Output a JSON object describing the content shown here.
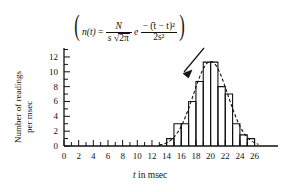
{
  "figure": {
    "title": "",
    "formula": {
      "lhs": "n(t)",
      "equals": "=",
      "frac1_num": "N",
      "frac1_den_s": "s",
      "frac1_den_radical": "2π",
      "e": "e",
      "frac2_num": "− (̄t − t)²",
      "frac2_den": "2s²",
      "plain": "n(t) = N / (s √(2π)) e^{ −(t̄ − t)² / 2s² }"
    },
    "annotation": {
      "name": "arrow-pointing-to-curve"
    }
  },
  "chart_data": {
    "type": "bar",
    "title": "",
    "xlabel": "t in msec",
    "ylabel": "Number of readings per msec",
    "ylabel_line1": "Number of readings",
    "ylabel_line2": "per msec",
    "xlim": [
      0,
      27
    ],
    "ylim": [
      0,
      13
    ],
    "xticks_major": [
      0,
      2,
      4,
      6,
      8,
      10,
      12,
      14,
      16,
      18,
      20,
      22,
      24,
      26
    ],
    "xticks_major_labels": [
      "0",
      "2",
      "4",
      "6",
      "8",
      "10",
      "12",
      "14",
      "16",
      "18",
      "20",
      "22",
      "24",
      "26"
    ],
    "xticks_minor_step": 1,
    "yticks_major": [
      0,
      2,
      4,
      6,
      8,
      10,
      12
    ],
    "yticks_major_labels": [
      "0",
      "2",
      "4",
      "6",
      "8",
      "10",
      "12"
    ],
    "yticks_minor_step": 1,
    "grid": false,
    "legend": false,
    "bin_width": 1,
    "categories": [
      14,
      15,
      16,
      17,
      18,
      19,
      20,
      21,
      22,
      23,
      24,
      25
    ],
    "values": [
      1,
      3,
      3,
      6,
      8.7,
      11.3,
      11.3,
      8,
      7,
      3,
      1.5,
      1
    ],
    "bars": [
      {
        "x_start": 14,
        "x_end": 15,
        "height": 1
      },
      {
        "x_start": 15,
        "x_end": 16,
        "height": 3
      },
      {
        "x_start": 16,
        "x_end": 17,
        "height": 3
      },
      {
        "x_start": 17,
        "x_end": 18,
        "height": 6
      },
      {
        "x_start": 18,
        "x_end": 19,
        "height": 8.7
      },
      {
        "x_start": 19,
        "x_end": 20,
        "height": 11.3
      },
      {
        "x_start": 20,
        "x_end": 21,
        "height": 11.3
      },
      {
        "x_start": 21,
        "x_end": 22,
        "height": 8
      },
      {
        "x_start": 22,
        "x_end": 23,
        "height": 7
      },
      {
        "x_start": 23,
        "x_end": 24,
        "height": 3
      },
      {
        "x_start": 24,
        "x_end": 25,
        "height": 1.5
      },
      {
        "x_start": 25,
        "x_end": 26,
        "height": 1
      }
    ],
    "curve": {
      "name": "gaussian-fit",
      "style": "dashed",
      "mean": 20.0,
      "sigma": 2.35,
      "amplitude": 11.4
    }
  }
}
